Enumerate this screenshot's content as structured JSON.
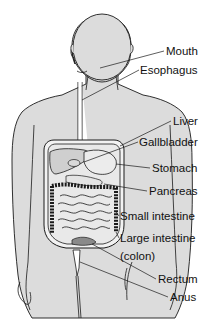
{
  "diagram": {
    "colors": {
      "background": "#ffffff",
      "body_fill": "#dcdcdc",
      "outline": "#1a1a1a",
      "organ_fill": "#e8e8e8"
    },
    "labels": [
      {
        "id": "mouth",
        "text": "Mouth",
        "x": 166,
        "y": 46
      },
      {
        "id": "esophagus",
        "text": "Esophagus",
        "x": 140,
        "y": 65
      },
      {
        "id": "liver",
        "text": "Liver",
        "x": 173,
        "y": 116
      },
      {
        "id": "gallbladder",
        "text": "Gallbladder",
        "x": 139,
        "y": 137
      },
      {
        "id": "stomach",
        "text": "Stomach",
        "x": 152,
        "y": 163
      },
      {
        "id": "pancreas",
        "text": "Pancreas",
        "x": 149,
        "y": 186
      },
      {
        "id": "small-intestine",
        "text": "Small intestine",
        "x": 120,
        "y": 211
      },
      {
        "id": "large-intestine",
        "text": "Large intestine",
        "x": 120,
        "y": 233
      },
      {
        "id": "colon",
        "text": "(colon)",
        "x": 120,
        "y": 251
      },
      {
        "id": "rectum",
        "text": "Rectum",
        "x": 158,
        "y": 274
      },
      {
        "id": "anus",
        "text": "Anus",
        "x": 170,
        "y": 292
      }
    ]
  }
}
